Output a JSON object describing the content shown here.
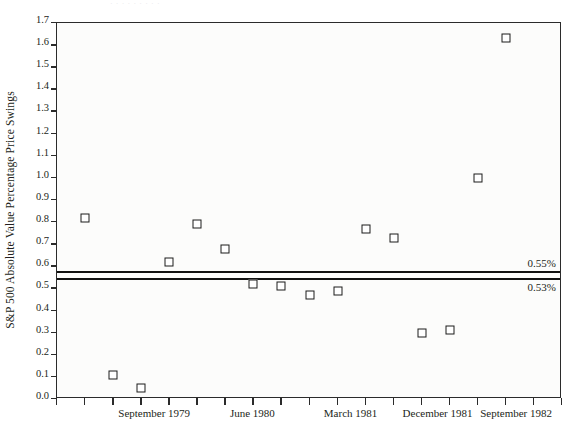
{
  "title_remnant": "·  ·   ·     ·      ·    ·  ·     ·   ·",
  "chart_data": {
    "type": "scatter",
    "title": "",
    "xlabel": "",
    "ylabel": "S&P 500 Absolute Value Percentage Price Swings",
    "ylim": [
      0.0,
      1.7
    ],
    "ytick_labels": [
      "0.0",
      "0.1",
      "0.2",
      "0.3",
      "0.4",
      "0.5",
      "0.6",
      "0.7",
      "0.8",
      "0.9",
      "1.0",
      "1.1",
      "1.2",
      "1.3",
      "1.4",
      "1.5",
      "1.6",
      "1.7"
    ],
    "ytick_values": [
      0.0,
      0.1,
      0.2,
      0.3,
      0.4,
      0.5,
      0.6,
      0.7,
      0.8,
      0.9,
      1.0,
      1.1,
      1.2,
      1.3,
      1.4,
      1.5,
      1.6,
      1.7
    ],
    "grid": false,
    "legend": "none",
    "x_tick_count": 18,
    "xtick_labels": [
      "September 1979",
      "June 1980",
      "March 1981",
      "December 1981",
      "September 1982"
    ],
    "xtick_label_positions": [
      3.5,
      7.0,
      10.5,
      13.6,
      16.4
    ],
    "series": [
      {
        "name": "S&P 500 Absolute Value Percentage Price Swings",
        "marker": "open-square",
        "x": [
          1,
          2,
          3,
          4,
          5,
          6,
          7,
          8,
          9,
          10,
          11,
          12,
          13,
          14,
          15,
          16
        ],
        "values": [
          0.82,
          0.11,
          0.05,
          0.62,
          0.79,
          0.68,
          0.52,
          0.51,
          0.47,
          0.49,
          0.77,
          0.73,
          0.3,
          0.31,
          1.0,
          1.63
        ]
      }
    ],
    "reference_lines": [
      {
        "label": "0.55%",
        "value": 0.58,
        "label_position": "right-above"
      },
      {
        "label": "0.53%",
        "value": 0.545,
        "label_position": "right-below"
      }
    ]
  },
  "colors": {
    "axis": "#2b2b2b",
    "marker_edge": "#1a1a1a",
    "marker_fill": "#ffffff",
    "plot_bg": "#fcfcfb",
    "refline": "#111111",
    "text": "#231f20"
  }
}
